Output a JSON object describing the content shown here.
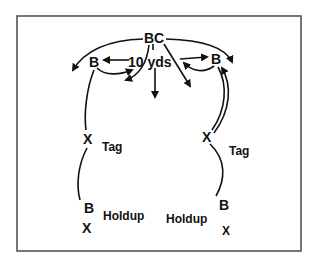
{
  "diagram": {
    "type": "football-play-diagram",
    "frame": {
      "x": 17,
      "y": 16,
      "width": 284,
      "height": 235,
      "stroke": "#555555"
    },
    "ink_color": "#111111",
    "labels": {
      "bc": "BC",
      "left_b_top": "B",
      "right_b_top": "B",
      "distance": "10 yds",
      "left_x_tag": "X",
      "left_tag": "Tag",
      "right_x_tag": "X",
      "right_tag": "Tag",
      "left_b_bottom": "B",
      "left_x_bottom": "X",
      "left_holdup": "Holdup",
      "right_holdup": "Holdup",
      "right_b_bottom": "B",
      "right_x_bottom": "X"
    },
    "nodes": [
      {
        "id": "bc",
        "label": "BC",
        "x": 153,
        "y": 37
      },
      {
        "id": "b-left",
        "label": "B",
        "x": 94,
        "y": 62
      },
      {
        "id": "b-right",
        "label": "B",
        "x": 216,
        "y": 58
      },
      {
        "id": "x-tag-left",
        "label": "X",
        "x": 88,
        "y": 140
      },
      {
        "id": "x-tag-right",
        "label": "X",
        "x": 207,
        "y": 138
      },
      {
        "id": "b-holdup-left",
        "label": "B",
        "x": 89,
        "y": 208
      },
      {
        "id": "x-holdup-left",
        "label": "X",
        "x": 87,
        "y": 228
      },
      {
        "id": "b-holdup-right",
        "label": "B",
        "x": 224,
        "y": 204
      },
      {
        "id": "x-holdup-right",
        "label": "X",
        "x": 227,
        "y": 230
      }
    ],
    "arrows": [
      {
        "from": "bc",
        "to": "far-left-downfield",
        "style": "curved"
      },
      {
        "from": "bc",
        "to": "far-right-downfield",
        "style": "curved"
      },
      {
        "from": "bc",
        "to": "center-downfield",
        "style": "straight"
      },
      {
        "from": "bc",
        "to": "right-diagonal",
        "style": "straight"
      },
      {
        "from": "bc",
        "to": "left-hook",
        "style": "curved"
      },
      {
        "from": "distance-label",
        "to": "b-left",
        "style": "straight"
      },
      {
        "from": "distance-label",
        "to": "b-right",
        "style": "straight"
      },
      {
        "from": "b-left",
        "to": "center",
        "style": "curved"
      },
      {
        "from": "b-right",
        "to": "center",
        "style": "curved"
      },
      {
        "from": "x-tag-right",
        "to": "b-right",
        "style": "curved-double"
      }
    ],
    "lines": [
      {
        "from": "b-left",
        "to": "x-tag-left"
      },
      {
        "from": "x-tag-left",
        "to": "b-holdup-left"
      },
      {
        "from": "b-right",
        "to": "x-tag-right"
      },
      {
        "from": "x-tag-right",
        "to": "b-holdup-right"
      }
    ]
  }
}
